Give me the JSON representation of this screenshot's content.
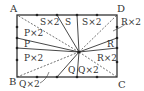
{
  "diagram": {
    "vertices": {
      "A": "A",
      "B": "B",
      "C": "C",
      "D": "D"
    },
    "regions": {
      "top_left": "S×2",
      "top_mid": "S",
      "top_right": "S×2",
      "left_top": "P×2",
      "left_mid": "P",
      "left_bottom": "P×2",
      "bottom_mid": "Q",
      "bottom_right": "Q×2",
      "bottom_callout": "Q×2",
      "right_mid": "R",
      "right_lower": "R×2",
      "right_callout": "R×2"
    },
    "colors": {
      "line": "#333333",
      "background": "#ffffff"
    }
  }
}
